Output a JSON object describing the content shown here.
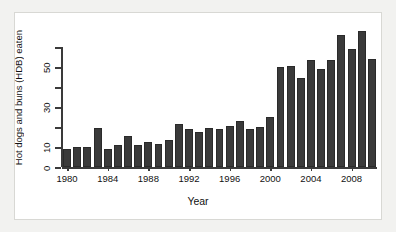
{
  "figure": {
    "background": "#ffffff",
    "page_background": "#f2f2f0",
    "bar_color": "#3a3a3a",
    "axis_color": "#3a3a3a"
  },
  "chart_data": {
    "type": "bar",
    "title": "",
    "xlabel": "Year",
    "ylabel": "Hot dogs and buns (HDB) eaten",
    "xlim": [
      1979.5,
      2010.5
    ],
    "ylim": [
      0,
      65
    ],
    "grid": false,
    "legend": null,
    "y_ticks": [
      0,
      10,
      20,
      30,
      40,
      50,
      60
    ],
    "y_tick_labels": [
      "0",
      "10",
      "",
      "30",
      "",
      "50",
      ""
    ],
    "x_ticks": [
      1980,
      1984,
      1988,
      1992,
      1996,
      2000,
      2004,
      2008
    ],
    "x_tick_labels": [
      "1980",
      "1984",
      "1988",
      "1992",
      "1996",
      "2000",
      "2004",
      "2008"
    ],
    "categories": [
      1980,
      1981,
      1982,
      1983,
      1984,
      1985,
      1986,
      1987,
      1988,
      1989,
      1990,
      1991,
      1992,
      1993,
      1994,
      1995,
      1996,
      1997,
      1998,
      1999,
      2000,
      2001,
      2002,
      2003,
      2004,
      2005,
      2006,
      2007,
      2008,
      2009,
      2010
    ],
    "values": [
      9.1,
      10.25,
      10.25,
      19.5,
      9.1,
      11,
      15.5,
      11.25,
      12.5,
      11.75,
      13.75,
      21.5,
      19,
      17.5,
      19.5,
      19,
      20.5,
      23,
      19,
      20,
      25,
      50,
      50.5,
      44.5,
      53.5,
      49,
      53.75,
      66,
      59,
      68,
      54
    ]
  }
}
